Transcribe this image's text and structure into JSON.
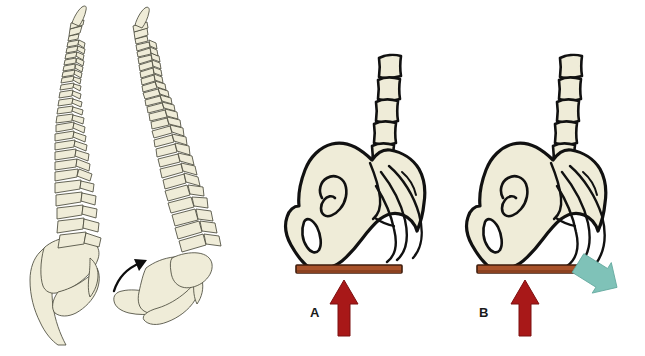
{
  "figure": {
    "background_color": "#ffffff",
    "width": 645,
    "height": 356
  },
  "palette": {
    "bone_fill": "#efecd8",
    "bone_fill_light": "#f3f1e0",
    "bone_outline_thin": "#4a4a3c",
    "bone_outline_thick": "#111111",
    "platform_fill": "#a8522a",
    "platform_fill_dark": "#8c4220",
    "platform_border": "#3f1d0d",
    "force_arrow_red": "#a81818",
    "force_arrow_red_dark": "#7d1010",
    "motion_arrow_teal": "#7fc2b8",
    "motion_arrow_teal_dark": "#63a89e",
    "rotation_arrow_black": "#0d0d0d",
    "label_text": "#1a1a1a"
  },
  "panels": [
    {
      "id": "spines",
      "name": "lateral-spine-comparison",
      "elements": [
        {
          "name": "spine-neutral",
          "type": "vertebral-column",
          "description": "Lateral view of vertebral column with normal curves, sacrum and pelvis"
        },
        {
          "name": "spine-tilted",
          "type": "vertebral-column",
          "description": "Lateral view of vertebral column with increased lumbar curve and anteriorly rotated sacrum"
        },
        {
          "name": "rotation-arrow",
          "type": "curved-arrow",
          "direction": "anterior-superior",
          "color": "#0d0d0d"
        }
      ]
    },
    {
      "id": "pelvis-a",
      "name": "pelvis-panel-a",
      "label": "A",
      "elements": [
        {
          "name": "lumbar-vertebrae-stack",
          "type": "vertebral-bodies",
          "count": 5
        },
        {
          "name": "innominate-bone",
          "type": "pelvis-lateral"
        },
        {
          "name": "sacrum-coccyx-curve",
          "type": "bone-outline"
        },
        {
          "name": "obturator-foramen",
          "type": "foramen"
        },
        {
          "name": "auricular-surface",
          "type": "articular-surface"
        },
        {
          "name": "support-platform",
          "type": "bar",
          "color": "#a8522a"
        },
        {
          "name": "ground-reaction-force-arrow",
          "type": "arrow",
          "direction": "up",
          "color": "#a81818"
        }
      ]
    },
    {
      "id": "pelvis-b",
      "name": "pelvis-panel-b",
      "label": "B",
      "elements": [
        {
          "name": "lumbar-vertebrae-stack",
          "type": "vertebral-bodies",
          "count": 5
        },
        {
          "name": "innominate-bone",
          "type": "pelvis-lateral"
        },
        {
          "name": "sacrum-coccyx-curve",
          "type": "bone-outline"
        },
        {
          "name": "obturator-foramen",
          "type": "foramen"
        },
        {
          "name": "auricular-surface",
          "type": "articular-surface"
        },
        {
          "name": "support-platform",
          "type": "bar",
          "color": "#a8522a"
        },
        {
          "name": "ground-reaction-force-arrow",
          "type": "arrow",
          "direction": "up",
          "color": "#a81818"
        },
        {
          "name": "posterior-rotation-arrow",
          "type": "arrow",
          "direction": "down-right",
          "color": "#7fc2b8"
        }
      ]
    }
  ],
  "labels": {
    "panel_a": "A",
    "panel_b": "B"
  }
}
